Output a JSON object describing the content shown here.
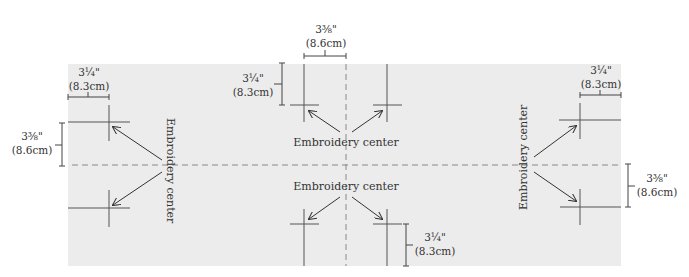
{
  "diagram": {
    "colors": {
      "panel": "#ececec",
      "lines": "#555555",
      "text": "#333333"
    },
    "labels": {
      "left_center": "Embroidery center",
      "top_center": "Embroidery center",
      "bottom_center": "Embroidery center",
      "right_center": "Embroidery center"
    },
    "dimensions": {
      "left_top_horizontal": {
        "inches": "3¼\"",
        "cm": "(8.3cm)"
      },
      "left_vertical": {
        "inches": "3⅜\"",
        "cm": "(8.6cm)"
      },
      "center_top_horizontal": {
        "inches": "3⅜\"",
        "cm": "(8.6cm)"
      },
      "center_top_vertical": {
        "inches": "3¼\"",
        "cm": "(8.3cm)"
      },
      "center_bottom_vertical": {
        "inches": "3¼\"",
        "cm": "(8.3cm)"
      },
      "right_top_horizontal": {
        "inches": "3¼\"",
        "cm": "(8.3cm)"
      },
      "right_vertical": {
        "inches": "3⅜\"",
        "cm": "(8.6cm)"
      }
    }
  }
}
